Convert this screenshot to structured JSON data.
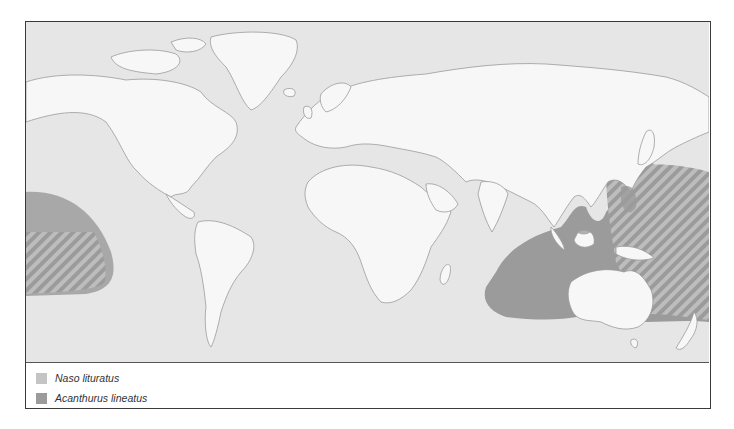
{
  "map": {
    "title": "",
    "projection": "world",
    "colors": {
      "ocean": "#e6e6e6",
      "land": "#f7f7f7",
      "coast": "#9a9a9a",
      "naso_lituratus": "#c4c4c4",
      "acanthurus_lineatus": "#9b9b9b",
      "hatch": "#bdbdbd"
    }
  },
  "legend": {
    "items": [
      {
        "label": "Naso lituratus",
        "color": "#c4c4c4"
      },
      {
        "label": "Acanthurus lineatus",
        "color": "#9b9b9b"
      }
    ]
  }
}
